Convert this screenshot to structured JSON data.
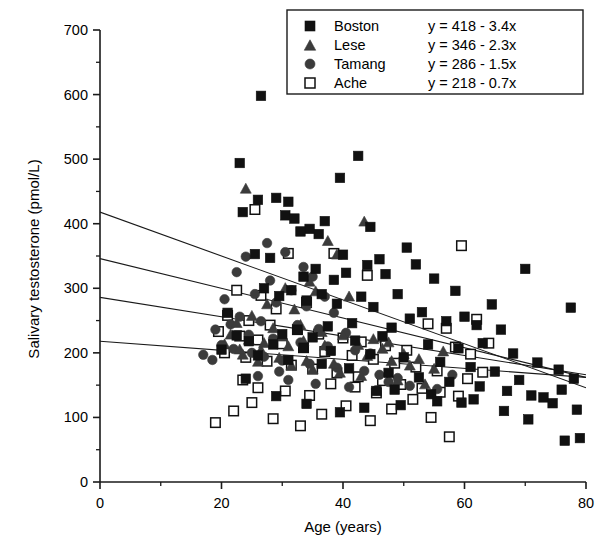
{
  "chart_data": {
    "type": "scatter",
    "title": "",
    "xlabel": "Age (years)",
    "ylabel": "Salivary testosterone (pmol/L)",
    "xlim": [
      0,
      80
    ],
    "ylim": [
      0,
      700
    ],
    "xticks": [
      0,
      20,
      40,
      60,
      80
    ],
    "xtick_labels": [
      "0",
      "20",
      "40",
      "60",
      "80"
    ],
    "xminor_step": 10,
    "yticks": [
      0,
      100,
      200,
      300,
      400,
      500,
      600,
      700
    ],
    "ytick_labels": [
      "0",
      "100",
      "200",
      "300",
      "400",
      "500",
      "600",
      "700"
    ],
    "yminor_step": 50,
    "grid": false,
    "legend_position": "top-right",
    "series": [
      {
        "name": "Boston",
        "equation": "y = 418 - 3.4x",
        "marker": "filled-square",
        "color": "#111111",
        "fit": {
          "intercept": 418,
          "slope": -3.4
        },
        "points": [
          [
            26.5,
            598
          ],
          [
            23.0,
            494
          ],
          [
            42.5,
            505
          ],
          [
            39.5,
            471
          ],
          [
            23.5,
            418
          ],
          [
            30.5,
            413
          ],
          [
            32.0,
            408
          ],
          [
            37.0,
            404
          ],
          [
            29.0,
            440
          ],
          [
            31.0,
            434
          ],
          [
            26.0,
            437
          ],
          [
            34.5,
            392
          ],
          [
            36.0,
            384
          ],
          [
            33.0,
            388
          ],
          [
            40.0,
            352
          ],
          [
            44.5,
            395
          ],
          [
            46.0,
            345
          ],
          [
            50.5,
            363
          ],
          [
            52.0,
            337
          ],
          [
            44.0,
            336
          ],
          [
            40.5,
            324
          ],
          [
            35.5,
            330
          ],
          [
            28.0,
            347
          ],
          [
            25.5,
            353
          ],
          [
            33.5,
            318
          ],
          [
            38.5,
            313
          ],
          [
            47.0,
            322
          ],
          [
            55.0,
            315
          ],
          [
            58.5,
            296
          ],
          [
            49.0,
            291
          ],
          [
            43.0,
            287
          ],
          [
            36.5,
            291
          ],
          [
            31.5,
            297
          ],
          [
            27.0,
            300
          ],
          [
            29.5,
            288
          ],
          [
            34.0,
            281
          ],
          [
            39.0,
            276
          ],
          [
            45.0,
            271
          ],
          [
            53.0,
            263
          ],
          [
            60.0,
            256
          ],
          [
            64.5,
            275
          ],
          [
            70.0,
            330
          ],
          [
            77.5,
            270
          ],
          [
            66.0,
            236
          ],
          [
            62.0,
            243
          ],
          [
            57.0,
            249
          ],
          [
            51.0,
            253
          ],
          [
            48.0,
            239
          ],
          [
            41.5,
            246
          ],
          [
            37.5,
            241
          ],
          [
            32.5,
            236
          ],
          [
            30.0,
            229
          ],
          [
            35.0,
            224
          ],
          [
            42.0,
            219
          ],
          [
            46.5,
            226
          ],
          [
            54.0,
            213
          ],
          [
            59.0,
            207
          ],
          [
            63.0,
            215
          ],
          [
            68.0,
            199
          ],
          [
            72.0,
            185
          ],
          [
            75.5,
            174
          ],
          [
            78.0,
            160
          ],
          [
            76.0,
            143
          ],
          [
            73.0,
            131
          ],
          [
            69.0,
            158
          ],
          [
            65.0,
            171
          ],
          [
            61.0,
            178
          ],
          [
            56.0,
            186
          ],
          [
            50.0,
            193
          ],
          [
            44.5,
            198
          ],
          [
            38.0,
            203
          ],
          [
            33.5,
            208
          ],
          [
            28.5,
            213
          ],
          [
            24.5,
            218
          ],
          [
            22.5,
            227
          ],
          [
            21.0,
            262
          ],
          [
            20.0,
            205
          ],
          [
            26.0,
            196
          ],
          [
            31.0,
            189
          ],
          [
            36.5,
            183
          ],
          [
            41.0,
            176
          ],
          [
            47.5,
            169
          ],
          [
            52.5,
            162
          ],
          [
            57.5,
            155
          ],
          [
            62.5,
            148
          ],
          [
            67.0,
            141
          ],
          [
            71.0,
            134
          ],
          [
            74.5,
            122
          ],
          [
            78.5,
            112
          ],
          [
            79.0,
            68
          ],
          [
            76.5,
            64
          ],
          [
            70.5,
            97
          ],
          [
            66.5,
            110
          ],
          [
            59.5,
            123
          ],
          [
            54.5,
            136
          ],
          [
            48.5,
            143
          ],
          [
            43.5,
            115
          ],
          [
            39.5,
            108
          ],
          [
            34.0,
            121
          ],
          [
            29.0,
            133
          ],
          [
            24.0,
            160
          ],
          [
            45.5,
            141
          ],
          [
            55.5,
            125
          ],
          [
            61.5,
            128
          ],
          [
            49.5,
            119
          ]
        ]
      },
      {
        "name": "Lese",
        "equation": "y = 346 - 2.3x",
        "marker": "filled-triangle",
        "color": "#3b3b3b",
        "fit": {
          "intercept": 346,
          "slope": -2.3
        },
        "points": [
          [
            24.0,
            455
          ],
          [
            37.5,
            374
          ],
          [
            39.0,
            353
          ],
          [
            34.5,
            311
          ],
          [
            35.5,
            296
          ],
          [
            30.5,
            301
          ],
          [
            41.0,
            288
          ],
          [
            43.5,
            404
          ],
          [
            27.5,
            276
          ],
          [
            32.0,
            268
          ],
          [
            25.0,
            258
          ],
          [
            22.5,
            247
          ],
          [
            28.5,
            239
          ],
          [
            33.0,
            244
          ],
          [
            36.5,
            233
          ],
          [
            40.0,
            228
          ],
          [
            45.0,
            222
          ],
          [
            47.5,
            217
          ],
          [
            31.0,
            211
          ],
          [
            26.5,
            205
          ],
          [
            23.5,
            198
          ],
          [
            29.5,
            193
          ],
          [
            34.0,
            188
          ],
          [
            38.5,
            184
          ],
          [
            42.5,
            213
          ],
          [
            46.5,
            207
          ],
          [
            50.0,
            199
          ],
          [
            52.5,
            191
          ],
          [
            21.5,
            229
          ],
          [
            24.5,
            221
          ],
          [
            27.0,
            216
          ],
          [
            30.0,
            226
          ],
          [
            33.5,
            219
          ],
          [
            37.0,
            212
          ],
          [
            44.0,
            196
          ],
          [
            48.0,
            188
          ],
          [
            51.0,
            181
          ],
          [
            55.0,
            176
          ],
          [
            20.5,
            214
          ],
          [
            23.0,
            206
          ],
          [
            26.0,
            187
          ],
          [
            31.5,
            181
          ],
          [
            35.0,
            175
          ],
          [
            39.5,
            170
          ],
          [
            43.0,
            165
          ],
          [
            49.0,
            158
          ],
          [
            53.5,
            152
          ],
          [
            56.5,
            203
          ]
        ]
      },
      {
        "name": "Tamang",
        "equation": "y = 286 - 1.5x",
        "marker": "filled-circle",
        "color": "#3b3b3b",
        "fit": {
          "intercept": 286,
          "slope": -1.5
        },
        "points": [
          [
            27.5,
            370
          ],
          [
            24.0,
            349
          ],
          [
            30.5,
            356
          ],
          [
            33.5,
            333
          ],
          [
            22.5,
            325
          ],
          [
            28.0,
            312
          ],
          [
            35.0,
            318
          ],
          [
            31.5,
            297
          ],
          [
            25.5,
            291
          ],
          [
            20.5,
            283
          ],
          [
            29.0,
            278
          ],
          [
            34.0,
            272
          ],
          [
            37.0,
            287
          ],
          [
            38.5,
            262
          ],
          [
            23.0,
            256
          ],
          [
            26.5,
            249
          ],
          [
            32.5,
            243
          ],
          [
            36.0,
            237
          ],
          [
            40.5,
            231
          ],
          [
            21.5,
            244
          ],
          [
            19.0,
            236
          ],
          [
            24.5,
            228
          ],
          [
            28.5,
            222
          ],
          [
            33.0,
            216
          ],
          [
            37.5,
            210
          ],
          [
            42.0,
            204
          ],
          [
            44.5,
            199
          ],
          [
            17.0,
            197
          ],
          [
            20.0,
            212
          ],
          [
            22.0,
            206
          ],
          [
            25.0,
            200
          ],
          [
            27.0,
            194
          ],
          [
            30.0,
            188
          ],
          [
            34.5,
            183
          ],
          [
            39.0,
            177
          ],
          [
            43.5,
            172
          ],
          [
            46.0,
            166
          ],
          [
            49.0,
            161
          ],
          [
            31.0,
            158
          ],
          [
            35.5,
            152
          ],
          [
            41.0,
            147
          ],
          [
            45.5,
            142
          ],
          [
            26.0,
            164
          ],
          [
            29.5,
            171
          ],
          [
            47.5,
            155
          ],
          [
            51.0,
            149
          ],
          [
            55.5,
            144
          ],
          [
            58.0,
            166
          ],
          [
            18.5,
            189
          ]
        ]
      },
      {
        "name": "Ache",
        "equation": "y = 218 - 0.7x",
        "marker": "open-square",
        "color": "#ffffff",
        "edge_color": "#111111",
        "fit": {
          "intercept": 218,
          "slope": -0.7
        },
        "points": [
          [
            25.5,
            422
          ],
          [
            31.0,
            354
          ],
          [
            22.5,
            297
          ],
          [
            26.5,
            289
          ],
          [
            34.0,
            278
          ],
          [
            38.5,
            354
          ],
          [
            44.0,
            320
          ],
          [
            29.0,
            268
          ],
          [
            21.0,
            258
          ],
          [
            24.5,
            250
          ],
          [
            28.0,
            243
          ],
          [
            32.5,
            236
          ],
          [
            36.0,
            229
          ],
          [
            40.0,
            223
          ],
          [
            43.0,
            217
          ],
          [
            47.0,
            211
          ],
          [
            50.5,
            204
          ],
          [
            54.0,
            245
          ],
          [
            57.0,
            238
          ],
          [
            59.5,
            366
          ],
          [
            62.0,
            252
          ],
          [
            19.5,
            233
          ],
          [
            23.0,
            226
          ],
          [
            26.0,
            220
          ],
          [
            30.0,
            214
          ],
          [
            33.5,
            208
          ],
          [
            37.0,
            202
          ],
          [
            41.5,
            196
          ],
          [
            45.0,
            190
          ],
          [
            48.5,
            184
          ],
          [
            52.0,
            178
          ],
          [
            55.5,
            172
          ],
          [
            58.5,
            209
          ],
          [
            61.0,
            198
          ],
          [
            64.0,
            215
          ],
          [
            20.5,
            200
          ],
          [
            24.0,
            193
          ],
          [
            27.5,
            187
          ],
          [
            31.5,
            181
          ],
          [
            35.0,
            175
          ],
          [
            39.0,
            169
          ],
          [
            42.5,
            163
          ],
          [
            46.5,
            157
          ],
          [
            49.5,
            151
          ],
          [
            53.0,
            145
          ],
          [
            56.0,
            139
          ],
          [
            59.0,
            133
          ],
          [
            19.0,
            92
          ],
          [
            22.0,
            110
          ],
          [
            25.0,
            123
          ],
          [
            28.5,
            98
          ],
          [
            33.0,
            87
          ],
          [
            36.5,
            105
          ],
          [
            40.5,
            118
          ],
          [
            44.5,
            95
          ],
          [
            48.0,
            113
          ],
          [
            51.5,
            128
          ],
          [
            54.5,
            100
          ],
          [
            57.5,
            70
          ],
          [
            30.5,
            141
          ],
          [
            34.5,
            134
          ],
          [
            38.0,
            152
          ],
          [
            42.0,
            147
          ],
          [
            45.5,
            138
          ],
          [
            26.0,
            146
          ],
          [
            23.5,
            158
          ],
          [
            60.5,
            160
          ],
          [
            63.0,
            170
          ]
        ]
      }
    ]
  },
  "legend": {
    "entries": [
      {
        "label": "Boston",
        "equation": "y = 418 - 3.4x",
        "icon": "filled-square-icon"
      },
      {
        "label": "Lese",
        "equation": "y = 346 - 2.3x",
        "icon": "filled-triangle-icon"
      },
      {
        "label": "Tamang",
        "equation": "y = 286 - 1.5x",
        "icon": "filled-circle-icon"
      },
      {
        "label": "Ache",
        "equation": "y = 218 - 0.7x",
        "icon": "open-square-icon"
      }
    ]
  },
  "axes": {
    "x_title": "Age (years)",
    "y_title": "Salivary testosterone (pmol/L)"
  }
}
